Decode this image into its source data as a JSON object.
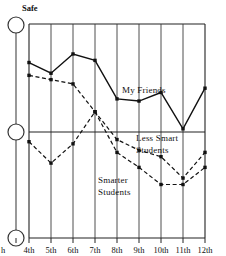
{
  "figure": {
    "top_label": "Safe",
    "x_axis_partial_left_label": "h",
    "background_color": "#ffffff",
    "ink_color": "#111111"
  },
  "annotations": {
    "my_friends": "My Friends",
    "less_smart_line1": "Less Smart",
    "less_smart_line2": "Students",
    "smarter_line1": "Smarter",
    "smarter_line2": "Students"
  },
  "axis_nodes": [
    {
      "name": "safe-node",
      "value": "Safe"
    },
    {
      "name": "middle-node",
      "value": ""
    },
    {
      "name": "bottom-node",
      "value": ""
    }
  ],
  "chart_data": {
    "type": "line",
    "title": "",
    "subtitle": "",
    "xlabel": "",
    "ylabel": "",
    "categories": [
      "4th",
      "5th",
      "6th",
      "7th",
      "8th",
      "9th",
      "10th",
      "11th",
      "12th"
    ],
    "tick_labels": [
      "4th",
      "5th",
      "6th",
      "7th",
      "8th",
      "9th",
      "10th",
      "11th",
      "12th"
    ],
    "ylim": [
      0,
      100
    ],
    "xlim": [
      0,
      8
    ],
    "grid": "vertical-gridlines-plus-one-horizontal-midline",
    "y_axis_markers": [
      "Safe",
      "",
      ""
    ],
    "legend_position": "inline-annotations",
    "series": [
      {
        "name": "My Friends",
        "style": "solid",
        "marker": "filled-square",
        "values": [
          82,
          77,
          86,
          83,
          65,
          64,
          68,
          51,
          70
        ]
      },
      {
        "name": "Less Smart Students",
        "style": "dashed",
        "marker": "filled-square",
        "values": [
          76,
          74,
          72,
          59,
          46,
          41,
          38,
          28,
          40
        ]
      },
      {
        "name": "Smarter Students",
        "style": "dashed",
        "marker": "filled-square",
        "values": [
          45,
          35,
          44,
          59,
          40,
          33,
          25,
          25,
          33
        ]
      }
    ]
  }
}
